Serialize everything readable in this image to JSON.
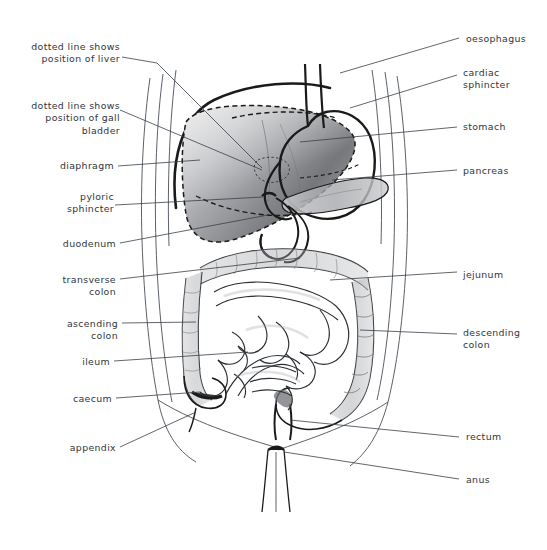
{
  "figure": {
    "background_color": "#ffffff",
    "text_color": "#2f3640",
    "line_color": "#3a3f47",
    "organ_outline_color": "#1a1a1a",
    "shading_color": "#8a8e93"
  },
  "labels_left": [
    {
      "id": "liver-dotted",
      "text": "dotted line shows\nposition of liver",
      "x": 30,
      "y": 41,
      "align": "left"
    },
    {
      "id": "gallbladder-dotted",
      "text": "dotted line shows\nposition of gall\nbladder",
      "x": 30,
      "y": 100,
      "align": "left"
    },
    {
      "id": "diaphragm",
      "text": "diaphragm",
      "x": 56,
      "y": 160,
      "align": "left"
    },
    {
      "id": "pyloric-sphincter",
      "text": "pyloric\nsphincter",
      "x": 56,
      "y": 191,
      "align": "left"
    },
    {
      "id": "duodenum",
      "text": "duodenum",
      "x": 55,
      "y": 238,
      "align": "left"
    },
    {
      "id": "transverse-colon",
      "text": "transverse\ncolon",
      "x": 56,
      "y": 274,
      "align": "left"
    },
    {
      "id": "ascending-colon",
      "text": "ascending\ncolon",
      "x": 56,
      "y": 318,
      "align": "left"
    },
    {
      "id": "ileum",
      "text": "ileum",
      "x": 86,
      "y": 356,
      "align": "left"
    },
    {
      "id": "caecum",
      "text": "caecum",
      "x": 78,
      "y": 393,
      "align": "left"
    },
    {
      "id": "appendix",
      "text": "appendix",
      "x": 63,
      "y": 442,
      "align": "left"
    }
  ],
  "labels_right": [
    {
      "id": "oesophagus",
      "text": "oesophagus",
      "x": 466,
      "y": 33
    },
    {
      "id": "cardiac-sphincter",
      "text": "cardiac\nsphincter",
      "x": 463,
      "y": 67
    },
    {
      "id": "stomach",
      "text": "stomach",
      "x": 463,
      "y": 121
    },
    {
      "id": "pancreas",
      "text": "pancreas",
      "x": 463,
      "y": 165
    },
    {
      "id": "jejunum",
      "text": "jejunum",
      "x": 463,
      "y": 269
    },
    {
      "id": "descending-colon",
      "text": "descending\ncolon",
      "x": 463,
      "y": 327
    },
    {
      "id": "rectum",
      "text": "rectum",
      "x": 466,
      "y": 431
    },
    {
      "id": "anus",
      "text": "anus",
      "x": 466,
      "y": 474
    }
  ],
  "leader_lines": [
    {
      "id": "leader-liver-dotted",
      "points": "122,57 157,63 262,168"
    },
    {
      "id": "leader-gallbladder",
      "points": "120,110 262,170"
    },
    {
      "id": "leader-diaphragm",
      "points": "118,166 200,160"
    },
    {
      "id": "leader-pyloric",
      "points": "115,205 263,197"
    },
    {
      "id": "leader-duodenum",
      "points": "120,243 268,215"
    },
    {
      "id": "leader-transverse-colon",
      "points": "120,279 300,258"
    },
    {
      "id": "leader-ascending-colon",
      "points": "122,323 196,322"
    },
    {
      "id": "leader-ileum",
      "points": "114,361 248,352"
    },
    {
      "id": "leader-caecum",
      "points": "116,398 200,392"
    },
    {
      "id": "leader-appendix",
      "points": "120,447 196,412"
    },
    {
      "id": "leader-oesophagus",
      "points": "459,38 340,73"
    },
    {
      "id": "leader-cardiac-sphincter",
      "points": "457,75 350,108"
    },
    {
      "id": "leader-stomach",
      "points": "457,127 300,142"
    },
    {
      "id": "leader-pancreas",
      "points": "457,170 332,180"
    },
    {
      "id": "leader-jejunum",
      "points": "457,272 330,280"
    },
    {
      "id": "leader-descending-colon",
      "points": "457,334 360,330"
    },
    {
      "id": "leader-rectum",
      "points": "459,437 290,420"
    },
    {
      "id": "leader-anus",
      "points": "459,479 284,452"
    }
  ]
}
